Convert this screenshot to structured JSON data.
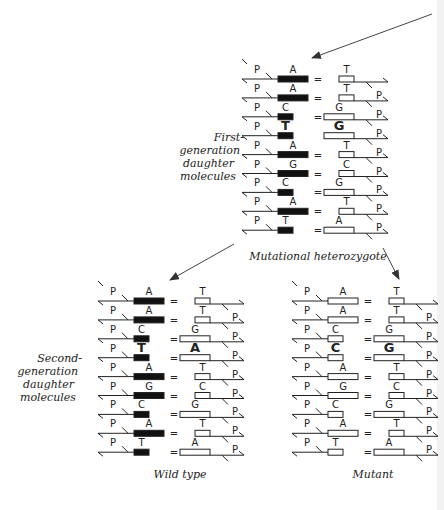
{
  "labels": {
    "first_generation": [
      "First-",
      "generation",
      "daughter",
      "molecules"
    ],
    "second_generation": [
      "Second-",
      "generation",
      "daughter",
      "molecules"
    ],
    "heterozygote": "Mutational heterozygote",
    "wild_type": "Wild type",
    "mutant": "Mutant"
  },
  "colors": {
    "ink": "#222222",
    "filled_strand": "#111111",
    "open_strand": "#ffffff",
    "arrow": "#555555"
  },
  "symbols": {
    "phosphate": "P",
    "pair_bond": "="
  },
  "blocks": {
    "heterozygote": {
      "x": 256,
      "y0": 79,
      "dy": 18.9,
      "left_filled": true,
      "rows": [
        {
          "left": "A",
          "right": "T",
          "bond": "=",
          "left_type": "purine",
          "p_right": false
        },
        {
          "left": "A",
          "right": "T",
          "bond": "=",
          "left_type": "purine",
          "p_right": true
        },
        {
          "left": "C",
          "right": "G",
          "bond": "=",
          "left_type": "pyrimidine",
          "p_right": true
        },
        {
          "left": "T",
          "right": "G",
          "bond": "",
          "left_type": "pyrimidine",
          "p_right": true,
          "mismatch": true
        },
        {
          "left": "A",
          "right": "T",
          "bond": "=",
          "left_type": "purine",
          "p_right": true
        },
        {
          "left": "G",
          "right": "C",
          "bond": "=",
          "left_type": "purine",
          "p_right": true
        },
        {
          "left": "C",
          "right": "G",
          "bond": "=",
          "left_type": "pyrimidine",
          "p_right": true
        },
        {
          "left": "A",
          "right": "T",
          "bond": "=",
          "left_type": "purine",
          "p_right": true
        },
        {
          "left": "T",
          "right": "A",
          "bond": "=",
          "left_type": "pyrimidine",
          "p_right": true
        }
      ]
    },
    "wild_type": {
      "x": 112,
      "y0": 301,
      "dy": 18.9,
      "left_filled": true,
      "rows": [
        {
          "left": "A",
          "right": "T",
          "bond": "=",
          "left_type": "purine",
          "p_right": false
        },
        {
          "left": "A",
          "right": "T",
          "bond": "=",
          "left_type": "purine",
          "p_right": true
        },
        {
          "left": "C",
          "right": "G",
          "bond": "=",
          "left_type": "pyrimidine",
          "p_right": true
        },
        {
          "left": "T",
          "right": "A",
          "bond": "=",
          "left_type": "pyrimidine",
          "p_right": true,
          "highlight": true
        },
        {
          "left": "A",
          "right": "T",
          "bond": "=",
          "left_type": "purine",
          "p_right": true
        },
        {
          "left": "G",
          "right": "C",
          "bond": "=",
          "left_type": "purine",
          "p_right": true
        },
        {
          "left": "C",
          "right": "G",
          "bond": "=",
          "left_type": "pyrimidine",
          "p_right": true
        },
        {
          "left": "A",
          "right": "T",
          "bond": "=",
          "left_type": "purine",
          "p_right": true
        },
        {
          "left": "T",
          "right": "A",
          "bond": "=",
          "left_type": "pyrimidine",
          "p_right": true
        }
      ]
    },
    "mutant": {
      "x": 306,
      "y0": 301,
      "dy": 18.9,
      "left_filled": false,
      "rows": [
        {
          "left": "A",
          "right": "T",
          "bond": "=",
          "left_type": "purine",
          "p_right": false
        },
        {
          "left": "A",
          "right": "T",
          "bond": "=",
          "left_type": "purine",
          "p_right": true
        },
        {
          "left": "C",
          "right": "G",
          "bond": "=",
          "left_type": "pyrimidine",
          "p_right": true
        },
        {
          "left": "C",
          "right": "G",
          "bond": "=",
          "left_type": "pyrimidine",
          "p_right": true,
          "highlight": true
        },
        {
          "left": "A",
          "right": "T",
          "bond": "=",
          "left_type": "purine",
          "p_right": true
        },
        {
          "left": "G",
          "right": "C",
          "bond": "=",
          "left_type": "purine",
          "p_right": true
        },
        {
          "left": "C",
          "right": "G",
          "bond": "=",
          "left_type": "pyrimidine",
          "p_right": true
        },
        {
          "left": "A",
          "right": "T",
          "bond": "=",
          "left_type": "purine",
          "p_right": true
        },
        {
          "left": "T",
          "right": "A",
          "bond": "=",
          "left_type": "pyrimidine",
          "p_right": true
        }
      ]
    }
  },
  "arrows": [
    {
      "name": "incoming-arrow",
      "x1": 432,
      "y1": 14,
      "x2": 312,
      "y2": 58
    },
    {
      "name": "arrow-to-wild-type",
      "x1": 234,
      "y1": 244,
      "x2": 170,
      "y2": 280
    },
    {
      "name": "arrow-to-mutant",
      "x1": 383,
      "y1": 248,
      "x2": 399,
      "y2": 279
    }
  ]
}
